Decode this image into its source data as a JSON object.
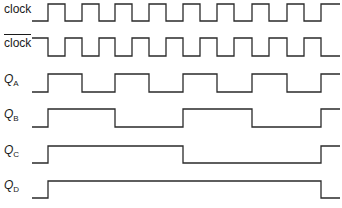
{
  "diagram": {
    "type": "timing-diagram",
    "stroke_color": "#2a2a2a",
    "signals": [
      {
        "id": "clock",
        "label": "clock",
        "subscript": "",
        "overbar": false,
        "italic": false,
        "label_y": 8,
        "y_high": 4,
        "y_low": 21,
        "x_start": 32,
        "x_end": 340,
        "initial": 0,
        "transitions": [
          48,
          65,
          82,
          99,
          115,
          132,
          149,
          166,
          183,
          200,
          217,
          234,
          252,
          269,
          287,
          304,
          321
        ]
      },
      {
        "id": "clock_bar",
        "label": "clock",
        "subscript": "",
        "overbar": true,
        "italic": false,
        "label_y": 42,
        "y_high": 38,
        "y_low": 56,
        "x_start": 32,
        "x_end": 340,
        "initial": 1,
        "transitions": [
          48,
          65,
          82,
          99,
          115,
          132,
          149,
          166,
          183,
          200,
          217,
          234,
          252,
          269,
          287,
          304,
          321
        ]
      },
      {
        "id": "QA",
        "label": "Q",
        "subscript": "A",
        "overbar": false,
        "italic": true,
        "label_y": 79,
        "y_high": 74,
        "y_low": 92,
        "x_start": 32,
        "x_end": 340,
        "initial": 0,
        "transitions": [
          48,
          82,
          115,
          149,
          183,
          217,
          252,
          287,
          321
        ]
      },
      {
        "id": "QB",
        "label": "Q",
        "subscript": "B",
        "overbar": false,
        "italic": true,
        "label_y": 114,
        "y_high": 109,
        "y_low": 127,
        "x_start": 32,
        "x_end": 340,
        "initial": 0,
        "transitions": [
          48,
          115,
          183,
          252,
          321
        ]
      },
      {
        "id": "QC",
        "label": "Q",
        "subscript": "C",
        "overbar": false,
        "italic": true,
        "label_y": 150,
        "y_high": 146,
        "y_low": 163,
        "x_start": 32,
        "x_end": 340,
        "initial": 0,
        "transitions": [
          48,
          183,
          321
        ]
      },
      {
        "id": "QD",
        "label": "Q",
        "subscript": "D",
        "overbar": false,
        "italic": true,
        "label_y": 185,
        "y_high": 181,
        "y_low": 198,
        "x_start": 32,
        "x_end": 340,
        "initial": 0,
        "transitions": [
          48,
          321
        ]
      }
    ]
  }
}
